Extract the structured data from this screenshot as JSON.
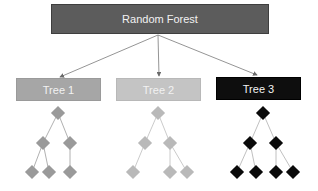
{
  "diagram": {
    "title": "Random Forest",
    "trees": [
      {
        "label": "Tree 1",
        "color": "#a6a6a6",
        "node_color": "#9a9a9a"
      },
      {
        "label": "Tree 2",
        "color": "#c4c4c4",
        "node_color": "#b9b9b9"
      },
      {
        "label": "Tree 3",
        "color": "#0e0e0e",
        "node_color": "#0a0a0a"
      }
    ],
    "root_color": "#5c5c5c",
    "edge_color": "#888888"
  }
}
